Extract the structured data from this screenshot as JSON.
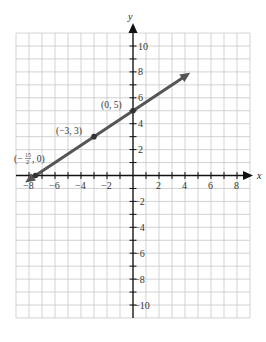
{
  "chart_data": {
    "type": "line",
    "title": "",
    "xlabel": "x",
    "ylabel": "y",
    "xlim": [
      -9,
      9
    ],
    "ylim": [
      -11,
      11
    ],
    "grid": true,
    "x_ticks": [
      -8,
      -6,
      -4,
      -2,
      2,
      4,
      6,
      8
    ],
    "y_ticks": [
      10,
      8,
      6,
      4,
      2,
      -2,
      -4,
      -6,
      -8,
      -10
    ],
    "series": [
      {
        "name": "line",
        "equation": "y = (2/3)x + 5",
        "x": [
          -8.5,
          4.5
        ],
        "y": [
          -0.67,
          8.0
        ],
        "color": "#555555"
      }
    ],
    "points": [
      {
        "x": 0,
        "y": 5,
        "label": "(0, 5)"
      },
      {
        "x": -3,
        "y": 3,
        "label": "(−3, 3)"
      },
      {
        "x": -7.5,
        "y": 0,
        "label": "(−¹⁵⁄₂, 0)"
      }
    ]
  },
  "labels": {
    "x_axis": "x",
    "y_axis": "y",
    "x_ticks": [
      "−8",
      "−6",
      "−4",
      "−2",
      "2",
      "4",
      "6",
      "8"
    ],
    "y_ticks": [
      "10",
      "8",
      "6",
      "4",
      "2",
      "−2",
      "−4",
      "−6",
      "−8",
      "−10"
    ],
    "p1": "(0, 5)",
    "p2": "(−3, 3)",
    "p3_prefix": "(−",
    "p3_num": "15",
    "p3_den": "2",
    "p3_suffix": ", 0)"
  }
}
